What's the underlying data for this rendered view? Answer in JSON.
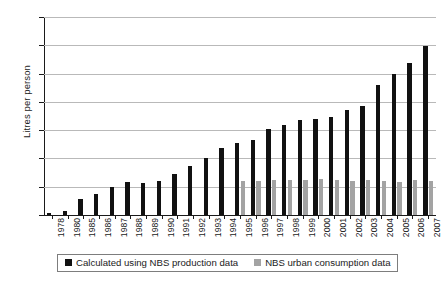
{
  "chart_data": {
    "type": "bar",
    "title": "",
    "xlabel": "",
    "ylabel": "Litres per person",
    "ylim": [
      0,
      35
    ],
    "ytick_step": 5,
    "yticks": [
      0,
      5,
      10,
      15,
      20,
      25,
      30,
      35
    ],
    "grid": true,
    "legend_position": "bottom",
    "categories": [
      "1978",
      "1980",
      "1985",
      "1986",
      "1987",
      "1988",
      "1989",
      "1990",
      "1991",
      "1992",
      "1993",
      "1994",
      "1995",
      "1996",
      "1997",
      "1998",
      "1999",
      "2000",
      "2001",
      "2002",
      "2003",
      "2004",
      "2005",
      "2006",
      "2007"
    ],
    "series": [
      {
        "name": "Calculated using NBS production data",
        "color": "#111111",
        "values": [
          0.3,
          0.7,
          2.9,
          3.8,
          5.0,
          5.9,
          5.7,
          6.0,
          7.2,
          8.7,
          10.0,
          11.8,
          12.8,
          13.2,
          15.2,
          16.0,
          16.8,
          17.0,
          17.4,
          18.6,
          19.2,
          22.9,
          25.0,
          26.9,
          29.8
        ]
      },
      {
        "name": "NBS urban consumption data",
        "color": "#a3a3a3",
        "values": [
          null,
          null,
          null,
          null,
          null,
          null,
          null,
          null,
          null,
          null,
          null,
          null,
          6.0,
          6.1,
          6.2,
          6.2,
          6.2,
          6.4,
          6.2,
          6.0,
          6.2,
          6.0,
          5.9,
          6.2,
          6.1
        ]
      }
    ]
  },
  "legend": {
    "entries": [
      {
        "label": "Calculated using NBS production data",
        "color": "#111111"
      },
      {
        "label": "NBS urban consumption data",
        "color": "#a3a3a3"
      }
    ]
  },
  "axis": {
    "y_title": "Litres per person"
  }
}
